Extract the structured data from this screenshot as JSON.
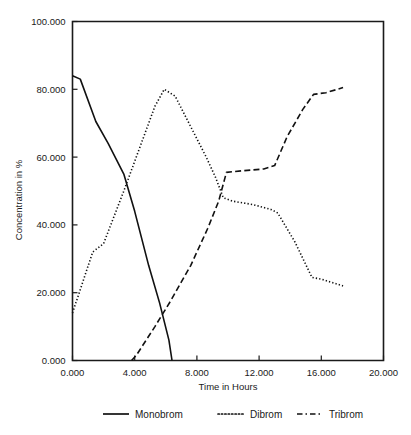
{
  "chart_data": {
    "type": "line",
    "title": "",
    "xlabel": "Time in Hours",
    "ylabel": "Concentration in %",
    "xlim": [
      0,
      20
    ],
    "ylim": [
      0,
      100
    ],
    "grid": false,
    "legend_position": "bottom",
    "xticks": [
      "0.000",
      "4.000",
      "8.000",
      "12.000",
      "16.000",
      "20.000"
    ],
    "xtick_values": [
      0,
      4,
      8,
      12,
      16,
      20
    ],
    "yticks": [
      "0.000",
      "20.000",
      "40.000",
      "60.000",
      "80.000",
      "100.000"
    ],
    "ytick_values": [
      0,
      20,
      40,
      60,
      80,
      100
    ],
    "series": [
      {
        "name": "Monobrom",
        "style": "solid",
        "color": "#111111",
        "x": [
          0.0,
          0.5,
          1.5,
          2.3,
          3.3,
          4.0,
          4.9,
          5.6,
          6.2,
          6.4
        ],
        "values": [
          84.0,
          83.0,
          70.5,
          64.0,
          55.0,
          44.0,
          28.0,
          17.0,
          6.0,
          0.0
        ]
      },
      {
        "name": "Dibrom",
        "style": "dotted",
        "color": "#111111",
        "x": [
          0.0,
          1.3,
          2.0,
          3.3,
          4.3,
          5.3,
          5.9,
          6.6,
          7.6,
          8.6,
          9.2,
          9.7,
          10.3,
          11.6,
          12.8,
          13.2,
          14.3,
          15.4,
          16.0,
          17.4
        ],
        "values": [
          14.0,
          32.0,
          34.5,
          50.0,
          62.5,
          75.0,
          80.0,
          78.0,
          69.0,
          60.0,
          54.0,
          48.0,
          47.0,
          46.0,
          44.5,
          43.5,
          35.0,
          24.5,
          24.0,
          22.0
        ]
      },
      {
        "name": "Tribrom",
        "style": "dashed",
        "color": "#111111",
        "x": [
          3.8,
          4.1,
          5.3,
          6.3,
          7.6,
          8.7,
          9.4,
          9.9,
          11.0,
          12.3,
          13.0,
          13.8,
          14.8,
          15.5,
          16.3,
          17.4
        ],
        "values": [
          0.0,
          1.5,
          10.0,
          17.5,
          28.0,
          39.0,
          47.0,
          55.5,
          56.0,
          56.5,
          57.5,
          66.0,
          74.0,
          78.5,
          79.0,
          80.5
        ]
      }
    ]
  },
  "legend": {
    "items": [
      {
        "label": "Monobrom",
        "style": "solid"
      },
      {
        "label": "Dibrom",
        "style": "dotted"
      },
      {
        "label": "Tribrom",
        "style": "dashed"
      }
    ]
  }
}
